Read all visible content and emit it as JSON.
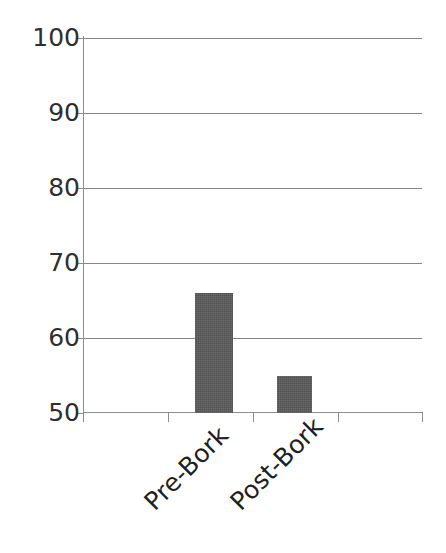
{
  "chart_data": {
    "type": "bar",
    "title": "",
    "subtitle": "",
    "xlabel": "",
    "ylabel": "",
    "categories": [
      "Pre-Bork",
      "Post-Bork"
    ],
    "values": [
      66,
      55
    ],
    "series": [
      {
        "name": "",
        "values": [
          66,
          55
        ]
      }
    ],
    "ylim": [
      50,
      100
    ],
    "yticks": [
      50,
      60,
      70,
      80,
      90,
      100
    ],
    "ytick_labels": [
      "50",
      "60",
      "70",
      "80",
      "90",
      "100"
    ],
    "grid": true,
    "grid_axis": "y",
    "legend": false,
    "legend_position": "none",
    "annotations": [],
    "bar_color": "#595959",
    "gridline_color": "#868686",
    "axis_color": "#8c8c8c",
    "background_color": "#ffffff",
    "tick_label_color": "#2f2f2f",
    "category_label_rotation": -45,
    "x_tick_count": 5
  },
  "axis": {
    "y_ticks": [
      {
        "label": "100",
        "value": 100
      },
      {
        "label": "90",
        "value": 90
      },
      {
        "label": "80",
        "value": 80
      },
      {
        "label": "70",
        "value": 70
      },
      {
        "label": "60",
        "value": 60
      },
      {
        "label": "50",
        "value": 50
      }
    ],
    "x_categories": [
      {
        "label": "Pre-Bork"
      },
      {
        "label": "Post-Bork"
      }
    ]
  }
}
